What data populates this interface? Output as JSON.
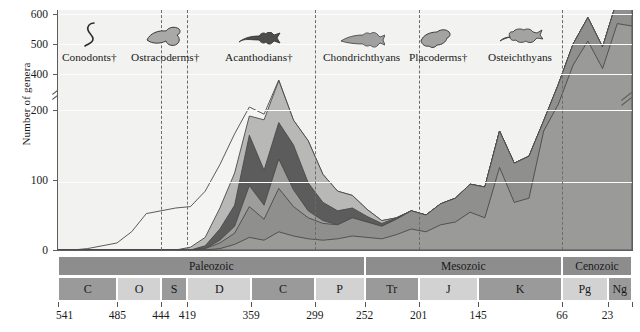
{
  "chart_data": {
    "type": "area",
    "title": "",
    "xlabel": "",
    "ylabel": "Number of genera",
    "ylim": [
      0,
      600
    ],
    "y_axis_break": {
      "from": 200,
      "to": 400
    },
    "y_ticks": [
      0,
      100,
      200,
      400,
      500,
      600
    ],
    "x_ticks_mya": [
      541,
      485,
      444,
      419,
      359,
      299,
      252,
      201,
      145,
      66,
      23
    ],
    "x_end_label": "Present",
    "grid": true,
    "legend_position": "top-inline",
    "series": [
      {
        "name": "Conodonts†",
        "color": "#f4f4f2",
        "values": [
          0,
          0,
          2,
          6,
          10,
          26,
          52,
          56,
          60,
          58,
          66,
          62,
          56,
          30,
          8,
          2,
          0,
          0,
          0,
          0,
          0,
          0,
          0,
          0,
          0,
          0,
          0,
          0,
          0,
          0,
          0,
          0,
          0,
          0,
          0,
          0,
          0,
          0,
          0,
          0
        ]
      },
      {
        "name": "Ostracoderms†",
        "color": "#b8b8b6",
        "values": [
          0,
          0,
          0,
          0,
          0,
          0,
          0,
          0,
          0,
          4,
          12,
          30,
          46,
          96,
          72,
          140,
          96,
          60,
          40,
          28,
          18,
          10,
          4,
          0,
          0,
          0,
          0,
          0,
          0,
          0,
          0,
          0,
          0,
          0,
          0,
          0,
          0,
          0,
          0,
          0
        ]
      },
      {
        "name": "Acanthodians†",
        "color": "#5c5c5c",
        "values": [
          0,
          0,
          0,
          0,
          0,
          0,
          0,
          0,
          0,
          0,
          4,
          16,
          30,
          72,
          50,
          108,
          64,
          40,
          26,
          20,
          14,
          8,
          4,
          2,
          0,
          0,
          0,
          0,
          0,
          0,
          0,
          0,
          0,
          0,
          0,
          0,
          0,
          0,
          0,
          0
        ]
      },
      {
        "name": "Chondrichthyans",
        "color": "#8f8f8d",
        "values": [
          0,
          0,
          0,
          0,
          0,
          0,
          0,
          0,
          0,
          0,
          2,
          8,
          16,
          44,
          30,
          62,
          42,
          30,
          24,
          20,
          26,
          22,
          18,
          22,
          26,
          24,
          30,
          34,
          40,
          44,
          52,
          56,
          60,
          74,
          66,
          70,
          78,
          72,
          80,
          78
        ]
      },
      {
        "name": "Placoderms†",
        "color": "#9d9d9b",
        "values": [
          0,
          0,
          0,
          0,
          0,
          0,
          0,
          0,
          0,
          0,
          0,
          4,
          10,
          30,
          20,
          42,
          24,
          10,
          4,
          0,
          0,
          0,
          0,
          0,
          0,
          0,
          0,
          0,
          0,
          0,
          0,
          0,
          0,
          0,
          0,
          0,
          0,
          0,
          0,
          0
        ]
      },
      {
        "name": "Osteichthyans",
        "color": "#9a9a98",
        "values": [
          0,
          0,
          0,
          0,
          0,
          0,
          0,
          0,
          0,
          0,
          0,
          2,
          8,
          18,
          14,
          26,
          20,
          16,
          14,
          16,
          20,
          18,
          16,
          22,
          30,
          26,
          36,
          40,
          54,
          46,
          118,
          68,
          74,
          170,
          300,
          430,
          510,
          418,
          568,
          560
        ]
      }
    ]
  },
  "taxa": [
    {
      "label": "Conodonts†",
      "icon": "conodont-silhouette",
      "x": 62,
      "fill": "#ffffff"
    },
    {
      "label": "Ostracoderms†",
      "icon": "ostracoderm-silhouette",
      "x": 131,
      "fill": "#a9a9a7"
    },
    {
      "label": "Acanthodians†",
      "icon": "acanthodian-silhouette",
      "x": 225,
      "fill": "#4d4d4d"
    },
    {
      "label": "Chondrichthyans",
      "icon": "chondrichthyan-silhouette",
      "x": 323,
      "fill": "#a0a0a0"
    },
    {
      "label": "Placoderms†",
      "icon": "placoderm-silhouette",
      "x": 409,
      "fill": "#a3a3a1"
    },
    {
      "label": "Osteichthyans",
      "icon": "osteichthyan-silhouette",
      "x": 488,
      "fill": "#a3a3a1"
    }
  ],
  "dividers_mya": [
    444,
    419,
    299,
    201,
    66
  ],
  "eras": [
    {
      "label": "Paleozoic",
      "start": 541,
      "end": 252
    },
    {
      "label": "Mesozoic",
      "start": 252,
      "end": 66
    },
    {
      "label": "Cenozoic",
      "start": 66,
      "end": 0
    }
  ],
  "periods": [
    {
      "label": "C",
      "start": 541,
      "end": 485,
      "shade": "dark"
    },
    {
      "label": "O",
      "start": 485,
      "end": 444,
      "shade": "light"
    },
    {
      "label": "S",
      "start": 444,
      "end": 419,
      "shade": "dark"
    },
    {
      "label": "D",
      "start": 419,
      "end": 359,
      "shade": "light"
    },
    {
      "label": "C",
      "start": 359,
      "end": 299,
      "shade": "dark"
    },
    {
      "label": "P",
      "start": 299,
      "end": 252,
      "shade": "light"
    },
    {
      "label": "Tr",
      "start": 252,
      "end": 201,
      "shade": "dark"
    },
    {
      "label": "J",
      "start": 201,
      "end": 145,
      "shade": "light"
    },
    {
      "label": "K",
      "start": 145,
      "end": 66,
      "shade": "dark"
    },
    {
      "label": "Pg",
      "start": 66,
      "end": 23,
      "shade": "light"
    },
    {
      "label": "Ng",
      "start": 23,
      "end": 0,
      "shade": "dark"
    }
  ],
  "axis": {
    "y_title": "Number of genera",
    "tick_0": "0",
    "tick_100": "100",
    "tick_200": "200",
    "tick_400": "400",
    "tick_500": "500",
    "tick_600": "600"
  },
  "time_labels": [
    "541",
    "485",
    "444",
    "419",
    "359",
    "299",
    "252",
    "201",
    "145",
    "66",
    "23",
    "Present"
  ]
}
